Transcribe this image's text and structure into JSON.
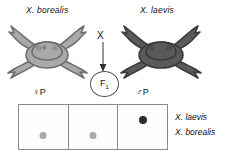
{
  "figure": {
    "type": "genetic-cross-diagram",
    "organism": "Xenopus",
    "background_color": "#ffffff"
  },
  "parents": {
    "female": {
      "species_label": "X. borealis",
      "sex_symbol": "♀",
      "sex_name": "female",
      "frog_color": "#a9a9a9",
      "frog_outline": "#6e6e6e"
    },
    "male": {
      "species_label": "X. laevis",
      "sex_symbol": "♂",
      "sex_name": "male",
      "frog_color": "#5a5a5a",
      "frog_outline": "#3a3a3a"
    }
  },
  "cross": {
    "symbol": "X",
    "arrow": "down-arrow",
    "offspring_label": "F",
    "offspring_subscript": "1"
  },
  "lane_headers": {
    "left": "♀P",
    "right": "♂P"
  },
  "gel": {
    "lanes": [
      {
        "name": "lane-1",
        "band": "X. borealis",
        "band_style": "light",
        "band_color": "#a8a8a8"
      },
      {
        "name": "lane-2",
        "band": "X. borealis",
        "band_style": "light",
        "band_color": "#a8a8a8"
      },
      {
        "name": "lane-3",
        "band": "X. laevis",
        "band_style": "dark",
        "band_color": "#2b2b2b"
      }
    ],
    "border_color": "#8a8a8a"
  },
  "band_legend": {
    "upper": "X. laevis",
    "lower": "X. borealis"
  }
}
